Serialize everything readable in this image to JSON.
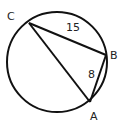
{
  "diagram": {
    "type": "circle-inscribed-triangle",
    "circle": {
      "cx": 57,
      "cy": 62,
      "r": 50
    },
    "points": [
      {
        "name": "C",
        "x": 29,
        "y": 23,
        "label_x": 7,
        "label_y": 20
      },
      {
        "name": "B",
        "x": 106,
        "y": 55,
        "label_x": 110,
        "label_y": 59
      },
      {
        "name": "A",
        "x": 90,
        "y": 102,
        "label_x": 90,
        "label_y": 120
      }
    ],
    "segments": [
      {
        "from": "C",
        "to": "B",
        "length_label": "15",
        "label_x": 66,
        "label_y": 31
      },
      {
        "from": "B",
        "to": "A",
        "length_label": "8",
        "label_x": 88,
        "label_y": 78
      },
      {
        "from": "C",
        "to": "A",
        "length_label": ""
      }
    ]
  }
}
